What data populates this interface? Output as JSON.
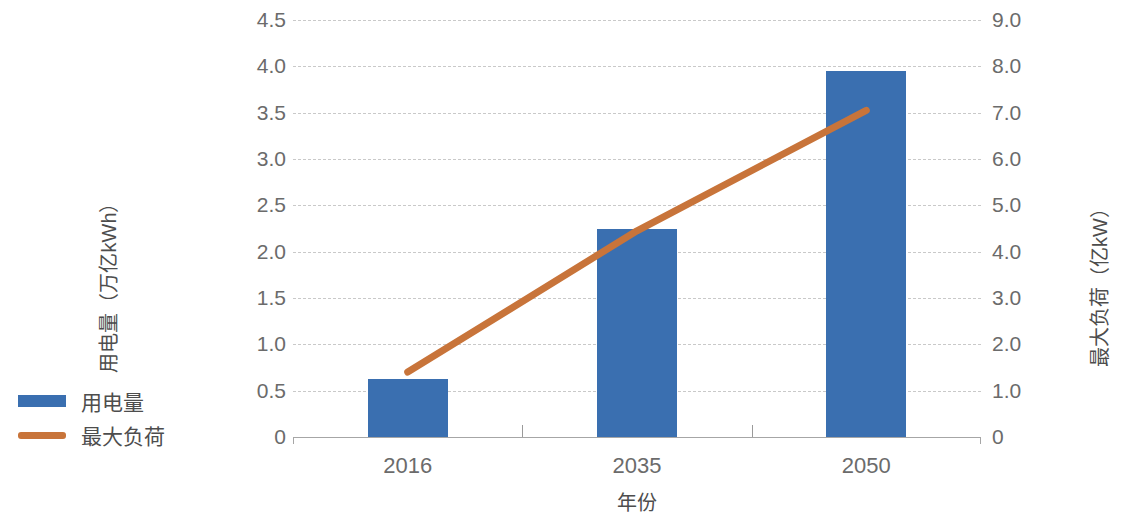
{
  "chart_data": {
    "type": "bar",
    "title": "",
    "xlabel": "年份",
    "categories": [
      "2016",
      "2035",
      "2050"
    ],
    "series": [
      {
        "name": "用电量",
        "type": "bar",
        "axis": "left",
        "unit": "万亿kWh",
        "color": "#3A6FB0",
        "values": [
          0.63,
          2.25,
          3.95
        ]
      },
      {
        "name": "最大负荷",
        "type": "line",
        "axis": "right",
        "unit": "亿kW",
        "color": "#C8743A",
        "values": [
          1.4,
          4.45,
          7.05
        ]
      }
    ],
    "left_axis": {
      "label": "用电量（万亿kWh）",
      "ylim": [
        0,
        4.5
      ],
      "ticks": [
        "0",
        "0.5",
        "1.0",
        "1.5",
        "2.0",
        "2.5",
        "3.0",
        "3.5",
        "4.0",
        "4.5"
      ],
      "tick_values": [
        0,
        0.5,
        1.0,
        1.5,
        2.0,
        2.5,
        3.0,
        3.5,
        4.0,
        4.5
      ]
    },
    "right_axis": {
      "label": "最大负荷（亿kW）",
      "ylim": [
        0,
        9.0
      ],
      "ticks": [
        "0",
        "1.0",
        "2.0",
        "3.0",
        "4.0",
        "5.0",
        "6.0",
        "7.0",
        "8.0",
        "9.0"
      ],
      "tick_values": [
        0,
        1.0,
        2.0,
        3.0,
        4.0,
        5.0,
        6.0,
        7.0,
        8.0,
        9.0
      ]
    },
    "grid": true,
    "legend_position": "left"
  },
  "legend": {
    "items": [
      {
        "label": "用电量",
        "marker": "bar-swatch",
        "color": "#3A6FB0"
      },
      {
        "label": "最大负荷",
        "marker": "line-swatch",
        "color": "#C8743A"
      }
    ]
  },
  "axes": {
    "x_title": "年份",
    "y_left_title": "用电量（万亿kWh）",
    "y_right_title": "最大负荷（亿kW）"
  }
}
